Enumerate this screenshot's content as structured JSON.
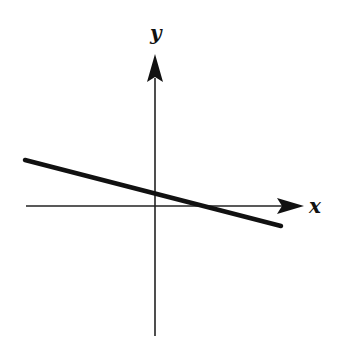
{
  "diagram": {
    "type": "coordinate-plane-line",
    "axes": {
      "x_label": "x",
      "y_label": "y",
      "x_arrow": "right",
      "y_arrow": "up",
      "origin_px": [
        155,
        206
      ]
    },
    "line": {
      "description": "straight line with negative slope, positive y-intercept, positive x-intercept",
      "slope_sign": "negative",
      "y_intercept_sign": "positive",
      "x_intercept_sign": "positive",
      "start_px": [
        25,
        160
      ],
      "end_px": [
        281,
        226
      ]
    },
    "colors": {
      "ink": "#111111",
      "background": "#ffffff"
    }
  }
}
